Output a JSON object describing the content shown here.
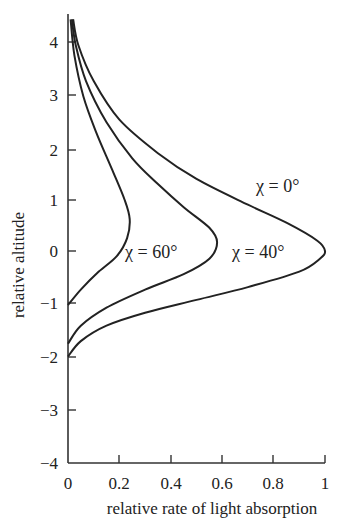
{
  "chart_data": {
    "type": "line",
    "title": "",
    "xlabel": "relative rate of light absorption",
    "ylabel": "relative altitude",
    "xlim": [
      0,
      1
    ],
    "ylim": [
      -4,
      4.5
    ],
    "xticks": [
      "0",
      "0.2",
      "0.4",
      "0.6",
      "0.8",
      "1"
    ],
    "yticks": [
      "−4",
      "−3",
      "−2",
      "−1",
      "0",
      "1",
      "2",
      "3",
      "4"
    ],
    "grid": false,
    "legend": "inline annotations",
    "series": [
      {
        "name": "χ = 0°",
        "label": "χ = 0°",
        "points": [
          [
            0.0,
            -2.05
          ],
          [
            0.05,
            -1.75
          ],
          [
            0.15,
            -1.45
          ],
          [
            0.3,
            -1.2
          ],
          [
            0.5,
            -0.95
          ],
          [
            0.7,
            -0.7
          ],
          [
            0.9,
            -0.4
          ],
          [
            0.98,
            -0.15
          ],
          [
            1.0,
            0.0
          ],
          [
            0.97,
            0.2
          ],
          [
            0.85,
            0.55
          ],
          [
            0.7,
            0.9
          ],
          [
            0.5,
            1.4
          ],
          [
            0.35,
            1.9
          ],
          [
            0.2,
            2.55
          ],
          [
            0.1,
            3.3
          ],
          [
            0.04,
            4.0
          ],
          [
            0.02,
            4.5
          ]
        ]
      },
      {
        "name": "χ = 40°",
        "label": "χ = 40°",
        "points": [
          [
            0.0,
            -1.8
          ],
          [
            0.05,
            -1.45
          ],
          [
            0.15,
            -1.1
          ],
          [
            0.3,
            -0.75
          ],
          [
            0.45,
            -0.45
          ],
          [
            0.55,
            -0.15
          ],
          [
            0.58,
            0.17
          ],
          [
            0.55,
            0.45
          ],
          [
            0.45,
            0.85
          ],
          [
            0.35,
            1.3
          ],
          [
            0.25,
            1.8
          ],
          [
            0.15,
            2.5
          ],
          [
            0.07,
            3.3
          ],
          [
            0.03,
            4.0
          ],
          [
            0.015,
            4.5
          ]
        ]
      },
      {
        "name": "χ = 60°",
        "label": "χ = 60°",
        "points": [
          [
            0.0,
            -1.05
          ],
          [
            0.05,
            -0.75
          ],
          [
            0.12,
            -0.4
          ],
          [
            0.19,
            -0.1
          ],
          [
            0.23,
            0.25
          ],
          [
            0.24,
            0.62
          ],
          [
            0.22,
            1.0
          ],
          [
            0.17,
            1.6
          ],
          [
            0.11,
            2.3
          ],
          [
            0.06,
            3.0
          ],
          [
            0.025,
            3.8
          ],
          [
            0.01,
            4.5
          ]
        ]
      }
    ],
    "annotations": [
      {
        "text": "χ = 0°",
        "x": 0.73,
        "y": 0.85
      },
      {
        "text": "χ = 40°",
        "x": 0.6,
        "y": 0.0
      },
      {
        "text": "χ = 60°",
        "x": 0.25,
        "y": 0.0
      }
    ]
  },
  "axes": {
    "x_label": "relative rate of light absorption",
    "y_label": "relative altitude",
    "x_ticks": [
      "0",
      "0.2",
      "0.4",
      "0.6",
      "0.8",
      "1"
    ],
    "y_ticks": [
      "−4",
      "−3",
      "−2",
      "−1",
      "0",
      "1",
      "2",
      "3",
      "4"
    ]
  },
  "labels": {
    "chi0": "χ = 0°",
    "chi40": "χ = 40°",
    "chi60": "χ = 60°"
  }
}
